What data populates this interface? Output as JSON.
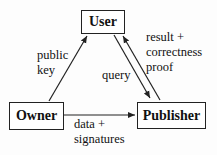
{
  "nodes": {
    "user": "User",
    "owner": "Owner",
    "publisher": "Publisher"
  },
  "edges": {
    "owner_to_user": {
      "line1": "public",
      "line2": "key"
    },
    "user_to_publisher": {
      "line1": "query"
    },
    "publisher_to_user": {
      "line1": "result +",
      "line2": "correctness",
      "line3": "proof"
    },
    "owner_to_publisher": {
      "line1": "data +",
      "line2": "signatures"
    }
  },
  "colors": {
    "stroke": "#222222",
    "text": "#111111",
    "background": "#fdfdfd"
  }
}
